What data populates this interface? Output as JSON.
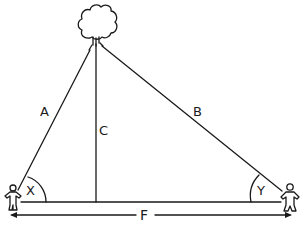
{
  "diagram": {
    "type": "triangulation-height-diagram",
    "labels": {
      "side_a": "A",
      "side_b": "B",
      "height_c": "C",
      "angle_x": "X",
      "angle_y": "Y",
      "baseline_f": "F"
    },
    "elements": {
      "top_object": "tree",
      "left_observer": "person",
      "right_observer": "person"
    },
    "colors": {
      "stroke": "#1a1a1a",
      "background": "#ffffff"
    }
  }
}
